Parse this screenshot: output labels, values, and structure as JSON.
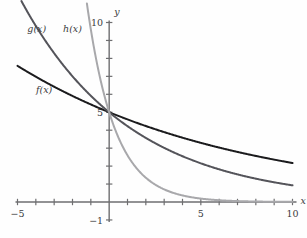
{
  "chart_data": {
    "type": "line",
    "title": "",
    "subtitle": "",
    "xlabel": "x",
    "ylabel": "y",
    "xlim": [
      -5,
      10
    ],
    "ylim": [
      -1,
      10
    ],
    "grid": false,
    "legend_position": "inline-curve-labels",
    "x_ticks": [
      -5,
      -4,
      -3,
      -2,
      -1,
      0,
      1,
      2,
      3,
      4,
      5,
      6,
      7,
      8,
      9,
      10
    ],
    "x_tick_labels": [
      {
        "value": -5,
        "text": "−5"
      },
      {
        "value": 5,
        "text": "5"
      },
      {
        "value": 10,
        "text": "10"
      }
    ],
    "y_ticks": [
      -1,
      0,
      1,
      2,
      3,
      4,
      5,
      6,
      7,
      8,
      9,
      10
    ],
    "y_tick_labels": [
      {
        "value": 10,
        "text": "10"
      },
      {
        "value": 5,
        "text": "5"
      },
      {
        "value": -1,
        "text": "−1"
      }
    ],
    "annotations": [
      {
        "name": "f-label",
        "text": "f(x)",
        "x": -3.55,
        "y": 6.05
      },
      {
        "name": "g-label",
        "text": "g(x)",
        "x": -3.95,
        "y": 9.45
      },
      {
        "name": "h-label",
        "text": "h(x)",
        "x": -2.0,
        "y": 9.45
      }
    ],
    "series": [
      {
        "name": "f(x)",
        "label": "f(x)",
        "color": "#1b1b1d",
        "width": 2.0,
        "intercept": 5,
        "decay_base": 0.92,
        "x": [
          -5,
          -4,
          -3,
          -2,
          -1,
          0,
          1,
          2,
          3,
          4,
          5,
          6,
          7,
          8,
          9,
          10
        ],
        "values": [
          7.72,
          7.11,
          6.54,
          6.02,
          5.54,
          5.0,
          4.6,
          4.23,
          3.89,
          3.58,
          3.3,
          3.03,
          2.79,
          2.57,
          2.36,
          2.17
        ]
      },
      {
        "name": "g(x)",
        "label": "g(x)",
        "color": "#54545a",
        "width": 2.0,
        "intercept": 5,
        "decay_base": 0.845,
        "x": [
          -5,
          -4,
          -3,
          -2,
          -1,
          0,
          1,
          2,
          3,
          4,
          5,
          6,
          7,
          8,
          9,
          10
        ],
        "values": [
          12.25,
          10.35,
          8.75,
          7.39,
          5.92,
          5.0,
          4.23,
          3.57,
          3.02,
          2.55,
          2.15,
          1.82,
          1.54,
          1.3,
          1.1,
          0.93
        ]
      },
      {
        "name": "h(x)",
        "label": "h(x)",
        "color": "#a8a8ab",
        "width": 2.0,
        "intercept": 5,
        "decay_base": 0.52,
        "x": [
          -5,
          -4,
          -3,
          -2,
          -1,
          0,
          1,
          2,
          3,
          4,
          5,
          6,
          7,
          8,
          9,
          10
        ],
        "values": [
          131.5,
          68.4,
          35.6,
          18.5,
          9.62,
          5.0,
          2.6,
          1.35,
          0.7,
          0.37,
          0.19,
          0.1,
          0.05,
          0.03,
          0.01,
          0.01
        ]
      }
    ]
  },
  "colors": {
    "axis": "#6e6e70",
    "text": "#3b3b3d",
    "background": "#fefefe",
    "f_curve": "#1b1b1d",
    "g_curve": "#54545a",
    "h_curve": "#a8a8ab"
  }
}
